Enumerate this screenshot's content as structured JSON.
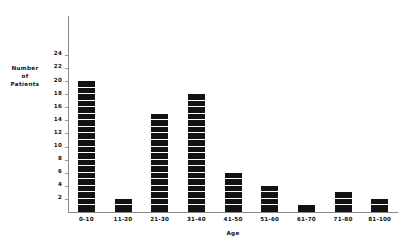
{
  "chart_data": {
    "type": "bar",
    "title": "",
    "subtitle": "",
    "xlabel": "Age",
    "ylabel": "Number of Patients",
    "ylabel_lines": [
      "Number",
      "of",
      "Patients"
    ],
    "categories": [
      "0-10",
      "11-20",
      "21-30",
      "31-40",
      "41-50",
      "51-60",
      "61-70",
      "71-80",
      "81-100"
    ],
    "values": [
      20,
      2,
      15,
      18,
      6,
      4,
      1,
      3,
      2
    ],
    "ylim": [
      0,
      24
    ],
    "ytick_step": 2,
    "yticks": [
      2,
      4,
      6,
      8,
      10,
      12,
      14,
      16,
      18,
      20,
      22,
      24
    ],
    "grid": false,
    "legend": null,
    "bar_style": "segmented-stacked-units",
    "bar_color": "#121212",
    "axis_color": "#8a8a8a",
    "background_color": "#ffffff"
  }
}
